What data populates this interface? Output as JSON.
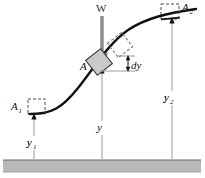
{
  "figure": {
    "title_alt": "Block A sliding on a smooth curved path with weight W and elevations y1, y, y2",
    "labels": {
      "weight": "W",
      "block_a": "A",
      "block_a1": "A",
      "block_a1_sub": "1",
      "block_a2": "A",
      "block_a2_sub": "2",
      "height_y": "y",
      "height_y1": "y",
      "height_y1_sub": "1",
      "height_y2": "y",
      "height_y2_sub": "2",
      "differential_dy": "dy"
    },
    "colors": {
      "curve": "#111111",
      "block_fill": "#c9c9c9",
      "block_stroke": "#3a3a3a",
      "dashed_block": "#6e6e6e",
      "weight_arrow": "#8c8c8c",
      "dimension_line": "#9a9a9a",
      "ground_fill": "#b8b8b8",
      "ground_top": "#6a6a6a",
      "text": "#111111",
      "background": "#ffffff"
    },
    "geometry": {
      "ground_y": 160,
      "ground_height": 12,
      "curve_start": [
        34,
        113
      ],
      "curve_end": [
        193,
        12
      ],
      "station_y1_x": 34,
      "station_y_x": 102,
      "station_y2_x": 172
    }
  }
}
